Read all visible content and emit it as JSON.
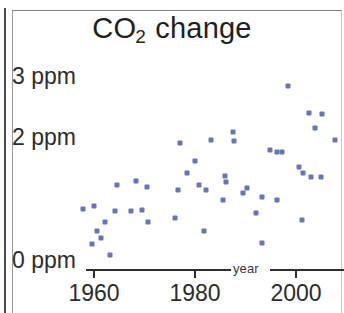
{
  "figure": {
    "title_main": "CO",
    "title_sub": "2",
    "title_rest": " change"
  },
  "axes": {
    "y_labels": [
      "3 ppm",
      "2 ppm",
      "0 ppm"
    ],
    "x_caption": "year",
    "x_tick_labels": [
      "1960",
      "1980",
      "2000"
    ]
  },
  "colors": {
    "marker": "#6877b4",
    "axis": "#2f2f2f",
    "text": "#231f20"
  },
  "chart_data": {
    "type": "scatter",
    "title": "CO2 change",
    "xlabel": "year",
    "ylabel": "ppm",
    "xlim": [
      1955,
      2011
    ],
    "ylim": [
      0,
      3.15
    ],
    "xticks": [
      1960,
      1980,
      2000
    ],
    "yticks": [
      0,
      2,
      3
    ],
    "ytick_labels": [
      "0 ppm",
      "2 ppm",
      "3 ppm"
    ],
    "grid": false,
    "legend": null,
    "marker_color": "#6877b4",
    "marker_shape": "square",
    "series": [
      {
        "name": "annual CO2 change",
        "points": [
          [
            1957.8,
            0.85
          ],
          [
            1960.0,
            0.9
          ],
          [
            1960.6,
            0.49
          ],
          [
            1959.6,
            0.28
          ],
          [
            1961.4,
            0.38
          ],
          [
            1963.2,
            0.1
          ],
          [
            1964.6,
            1.25
          ],
          [
            1968.3,
            1.31
          ],
          [
            1964.2,
            0.82
          ],
          [
            1967.4,
            0.82
          ],
          [
            1970.5,
            1.21
          ],
          [
            1969.5,
            0.84
          ],
          [
            1970.7,
            0.64
          ],
          [
            1962.2,
            0.64
          ],
          [
            1977.0,
            1.93
          ],
          [
            1983.2,
            1.98
          ],
          [
            1980.0,
            1.64
          ],
          [
            1978.4,
            1.44
          ],
          [
            1980.8,
            1.25
          ],
          [
            1976.6,
            1.16
          ],
          [
            1982.2,
            1.16
          ],
          [
            1986.1,
            1.3
          ],
          [
            1985.5,
            1.0
          ],
          [
            1976.0,
            0.7
          ],
          [
            1981.7,
            0.49
          ],
          [
            1987.5,
            2.11
          ],
          [
            1987.7,
            1.97
          ],
          [
            1994.8,
            1.82
          ],
          [
            1996.2,
            1.79
          ],
          [
            1985.9,
            1.39
          ],
          [
            1989.5,
            1.11
          ],
          [
            1990.3,
            1.2
          ],
          [
            1993.3,
            1.05
          ],
          [
            1996.2,
            1.0
          ],
          [
            1992.0,
            0.79
          ],
          [
            1993.2,
            0.3
          ],
          [
            1998.4,
            2.87
          ],
          [
            2002.6,
            2.43
          ],
          [
            2005.2,
            2.41
          ],
          [
            2003.7,
            2.18
          ],
          [
            2007.8,
            1.98
          ],
          [
            1997.2,
            1.79
          ],
          [
            2000.6,
            1.54
          ],
          [
            2001.4,
            1.44
          ],
          [
            2005.0,
            1.38
          ],
          [
            2003.0,
            1.38
          ],
          [
            2001.2,
            0.67
          ]
        ]
      }
    ]
  }
}
